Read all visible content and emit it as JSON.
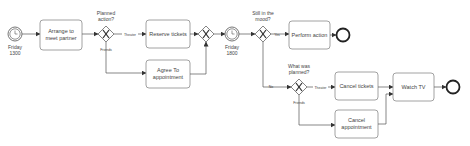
{
  "diagram": {
    "type": "BPMN process",
    "events": {
      "start_timer": {
        "label_line1": "Friday",
        "label_line2": "1300"
      },
      "mid_timer": {
        "label_line1": "Friday",
        "label_line2": "1800"
      },
      "end1": {
        "label": ""
      },
      "end2": {
        "label": ""
      }
    },
    "tasks": {
      "arrange": {
        "line1": "Arrange to",
        "line2": "meet partner"
      },
      "reserve": {
        "line1": "Reserve tickets"
      },
      "agree": {
        "line1": "Agree To",
        "line2": "appointment"
      },
      "perform": {
        "line1": "Perform action"
      },
      "cancel_tickets": {
        "line1": "Cancel tickets"
      },
      "cancel_appt": {
        "line1": "Cancel",
        "line2": "appointment"
      },
      "watch_tv": {
        "line1": "Watch TV"
      }
    },
    "gateways": {
      "planned": {
        "line1": "Planned",
        "line2": "action?"
      },
      "join": {
        "line1": ""
      },
      "mood": {
        "line1": "Still in the",
        "line2": "mood?"
      },
      "what": {
        "line1": "What was",
        "line2": "planned?"
      }
    },
    "flow_labels": {
      "theater1": "Theater",
      "friends1": "Friends",
      "yes": "Yes",
      "no": "No",
      "theater2": "Theater",
      "friends2": "Friends"
    }
  }
}
